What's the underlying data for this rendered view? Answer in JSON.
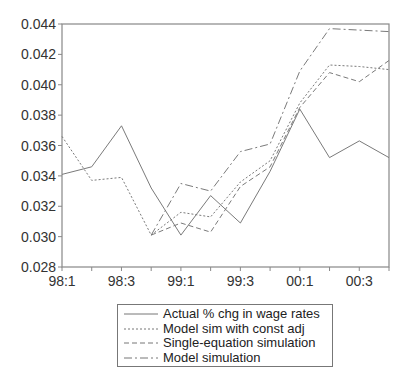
{
  "chart_data": {
    "type": "line",
    "title": "",
    "xlabel": "",
    "ylabel": "",
    "x": [
      "98:1",
      "98:2",
      "98:3",
      "98:4",
      "99:1",
      "99:2",
      "99:3",
      "99:4",
      "00:1",
      "00:2",
      "00:3",
      "00:4"
    ],
    "x_tick_labels": [
      "98:1",
      "98:3",
      "99:1",
      "99:3",
      "00:1",
      "00:3"
    ],
    "y_tick_labels": [
      "0.028",
      "0.030",
      "0.032",
      "0.034",
      "0.036",
      "0.038",
      "0.040",
      "0.042",
      "0.044"
    ],
    "ylim": [
      0.028,
      0.044
    ],
    "grid": false,
    "legend_position": "bottom-center",
    "series": [
      {
        "name": "Actual % chg in wage rates",
        "style": "solid",
        "values": [
          0.0341,
          0.0346,
          0.0373,
          0.0332,
          0.0301,
          0.0327,
          0.0309,
          0.0343,
          0.0384,
          0.0352,
          0.0363,
          0.0352
        ]
      },
      {
        "name": "Model sim with const adj",
        "style": "dotted",
        "values": [
          0.0366,
          0.0337,
          0.0339,
          0.0301,
          0.0316,
          0.0313,
          0.0336,
          0.035,
          0.0388,
          0.0413,
          0.0412,
          0.041
        ]
      },
      {
        "name": "Single-equation simulation",
        "style": "dashed",
        "values": [
          null,
          null,
          null,
          0.0301,
          0.0309,
          0.0303,
          0.0333,
          0.0346,
          0.0385,
          0.0408,
          0.0402,
          0.0416
        ]
      },
      {
        "name": "Model simulation",
        "style": "dashdot",
        "values": [
          null,
          null,
          null,
          0.0301,
          0.0335,
          0.033,
          0.0356,
          0.0361,
          0.0409,
          0.0437,
          0.0436,
          0.0435
        ]
      }
    ]
  },
  "legend": {
    "items": [
      {
        "label": "Actual % chg in wage rates",
        "dash": ""
      },
      {
        "label": "Model sim with const adj",
        "dash": "2,2"
      },
      {
        "label": "Single-equation simulation",
        "dash": "5,3"
      },
      {
        "label": "Model simulation",
        "dash": "8,3,2,3"
      }
    ]
  },
  "colors": {
    "line": "#7a7a7a",
    "axis": "#888888",
    "text": "#333333"
  }
}
